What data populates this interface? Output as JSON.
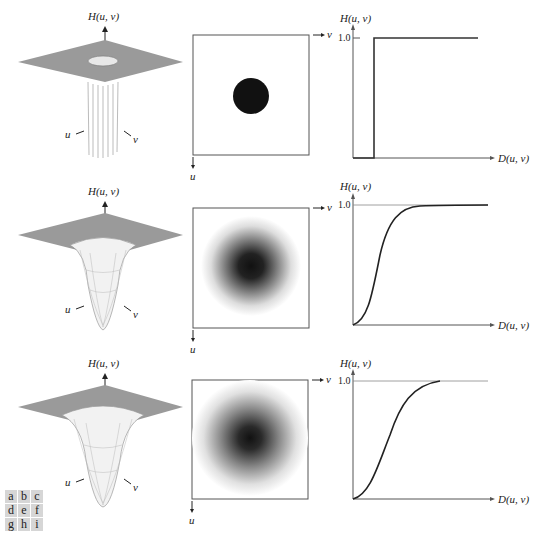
{
  "figure": {
    "rows": [
      {
        "name": "ideal",
        "surface": {
          "axis_label": "H(u, v)",
          "u_label": "u",
          "v_label": "v"
        },
        "image": {
          "u_label": "u",
          "v_label": "v"
        },
        "profile": {
          "ylabel": "H(u, v)",
          "xlabel": "D(u, v)",
          "ytick": "1.0"
        }
      },
      {
        "name": "butterworth",
        "surface": {
          "axis_label": "H(u, v)",
          "u_label": "u",
          "v_label": "v"
        },
        "image": {
          "u_label": "u",
          "v_label": "v"
        },
        "profile": {
          "ylabel": "H(u, v)",
          "xlabel": "D(u, v)",
          "ytick": "1.0"
        }
      },
      {
        "name": "gaussian",
        "surface": {
          "axis_label": "H(u, v)",
          "u_label": "u",
          "v_label": "v"
        },
        "image": {
          "u_label": "u",
          "v_label": "v"
        },
        "profile": {
          "ylabel": "H(u, v)",
          "xlabel": "D(u, v)",
          "ytick": "1.0"
        }
      }
    ],
    "panel_key": [
      "a",
      "b",
      "c",
      "d",
      "e",
      "f",
      "g",
      "h",
      "i"
    ],
    "colors": {
      "plane": "#9a9a9a",
      "curve": "#222222",
      "frame": "#555555"
    }
  }
}
